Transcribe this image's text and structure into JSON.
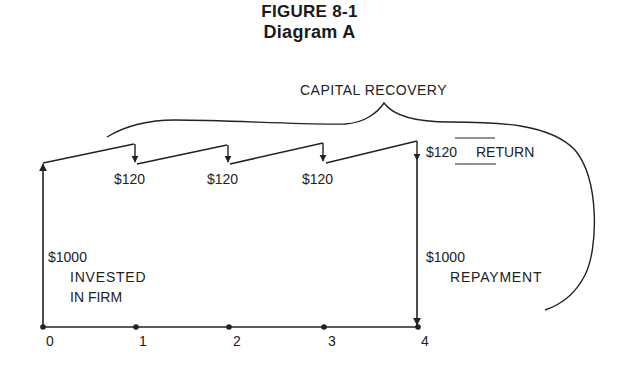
{
  "figure": {
    "title": "FIGURE 8-1",
    "subtitle": "Diagram A"
  },
  "labels": {
    "brace": "CAPITAL RECOVERY",
    "returns": [
      "$120",
      "$120",
      "$120"
    ],
    "final_return_amount": "$120",
    "final_return_word": "RETURN",
    "investment_amount": "$1000",
    "investment_line1": "INVESTED",
    "investment_line2": "IN FIRM",
    "repayment_amount": "$1000",
    "repayment_word": "REPAYMENT"
  },
  "timeline": {
    "periods": [
      "0",
      "1",
      "2",
      "3",
      "4"
    ]
  },
  "colors": {
    "ink": "#222222",
    "background": "#ffffff"
  }
}
